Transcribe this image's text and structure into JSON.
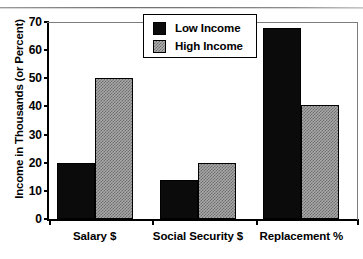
{
  "chart_data": {
    "type": "bar",
    "title": "",
    "xlabel": "",
    "ylabel": "Income in Thousands (or Percent)",
    "categories": [
      "Salary $",
      "Social Security $",
      "Replacement %"
    ],
    "series": [
      {
        "name": "Low Income",
        "color": "#0b0b0b",
        "fill": "solid-black",
        "values": [
          20,
          14,
          68
        ]
      },
      {
        "name": "High Income",
        "color": "#a8a8a8",
        "fill": "gray-checker",
        "values": [
          50,
          20,
          40.5
        ]
      }
    ],
    "ylim": [
      0,
      70
    ],
    "yticks": [
      0,
      10,
      20,
      30,
      40,
      50,
      60,
      70
    ],
    "ytick_labels": [
      "0",
      "10",
      "20",
      "30",
      "40",
      "50",
      "60",
      "70"
    ],
    "grid": false,
    "legend_position": "top-center"
  },
  "legend": {
    "items": [
      {
        "label": "Low Income"
      },
      {
        "label": "High Income"
      }
    ]
  }
}
